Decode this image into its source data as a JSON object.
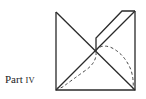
{
  "figure": {
    "label_prefix": "Part",
    "label_numeral": "IV",
    "stroke_color": "#2a2a2a",
    "background": "#ffffff"
  }
}
